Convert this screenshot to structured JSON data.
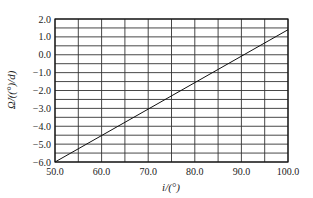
{
  "chart_data": {
    "type": "line",
    "title": "",
    "xlabel": "i/(°)",
    "ylabel": "Ω̇/((°)/d)",
    "xlim": [
      50.0,
      100.0
    ],
    "ylim": [
      -6.0,
      2.0
    ],
    "x_ticks": [
      "50.0",
      "60.0",
      "70.0",
      "80.0",
      "90.0",
      "100.0"
    ],
    "y_ticks": [
      "2.0",
      "1.0",
      "0.0",
      "-1.0",
      "-2.0",
      "-3.0",
      "-4.0",
      "-5.0",
      "-6.0"
    ],
    "grid": true,
    "x_grid_step": 5,
    "y_grid_step": 0.5,
    "legend": null,
    "series": [
      {
        "name": "Ω̇ vs i",
        "x": [
          50.0,
          100.0
        ],
        "y": [
          -6.0,
          1.4
        ]
      }
    ]
  }
}
